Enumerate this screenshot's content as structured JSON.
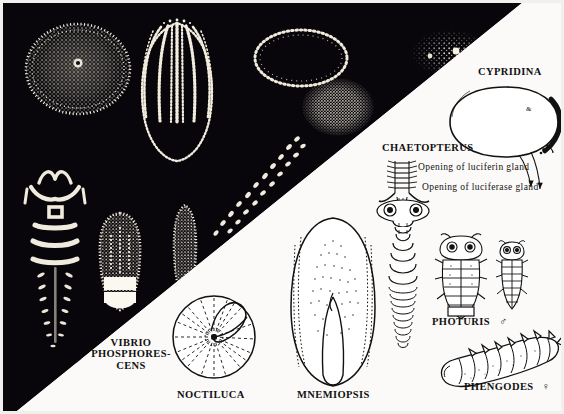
{
  "plate": {
    "title": "Bioluminescent organisms plate",
    "background_dark": "#08060a",
    "background_light": "#fbfaf8",
    "ink": "#111111",
    "glow": "#f5f3ea"
  },
  "labels": {
    "cypridina": "CYPRIDINA",
    "chaetopterus": "CHAETOPTERUS",
    "luciferin": "Opening of luciferin gland",
    "luciferase": "Opening of luciferase gland",
    "vibrio_line1": "VIBRIO",
    "vibrio_line2": "PHOSPHORES-",
    "vibrio_line3": "CENS",
    "noctiluca": "NOCTILUCA",
    "mnemiopsis": "MNEMIOPSIS",
    "photuris": "PHOTURIS",
    "photuris_sex": "♂",
    "phengodes": "PHENGODES",
    "phengodes_sex": "♀"
  },
  "figures": {
    "dark_side": [
      "luminous-sphere-colony",
      "glowing-ctenophore",
      "dotted-ellipse-outline",
      "dense-luminous-blob",
      "dotted-chain-of-light",
      "scattered-spark-cluster",
      "glowing-beetle-larva",
      "glowing-firefly-body",
      "glowing-larva-slender",
      "bacteria-speckle-patch"
    ],
    "light_side": [
      "cypridina-ostracod",
      "chaetopterus-worm",
      "noctiluca-dinoflagellate",
      "mnemiopsis-ctenophore",
      "phengodes-larva-dorsal",
      "photuris-beetle",
      "photuris-beetle-small",
      "phengodes-female-larva"
    ]
  }
}
